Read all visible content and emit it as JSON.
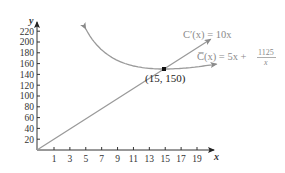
{
  "chart_data": {
    "type": "line",
    "title": "",
    "xlabel": "x",
    "ylabel": "y",
    "xlim": [
      0,
      20
    ],
    "ylim": [
      0,
      230
    ],
    "grid": false,
    "x_ticks": [
      1,
      3,
      5,
      7,
      9,
      11,
      13,
      15,
      17,
      19
    ],
    "y_ticks": [
      20,
      40,
      60,
      80,
      100,
      120,
      140,
      160,
      180,
      200,
      220
    ],
    "series": [
      {
        "name": "C'(x) = 10x",
        "label_main": "C′(x) = 10x",
        "formula": "10x",
        "x": [
          0,
          15,
          20.5
        ],
        "values": [
          0,
          150,
          205
        ],
        "color": "#9a9a9a"
      },
      {
        "name": "C̅(x) = 5x + 1125/x",
        "label_main": "C̅(x) = 5x + ",
        "label_num": "1125",
        "label_den": "x",
        "formula": "5x + 1125/x",
        "x": [
          6,
          7,
          8,
          9,
          10,
          11,
          12,
          13,
          14,
          15,
          16,
          17,
          18,
          19,
          20
        ],
        "values": [
          217.5,
          195.7,
          180.6,
          170,
          162.5,
          157.3,
          153.8,
          151.5,
          150.4,
          150,
          150.3,
          151.2,
          152.5,
          154.2,
          156.3
        ],
        "color": "#9a9a9a"
      }
    ],
    "annotations": [
      {
        "text": "(15, 150)",
        "x": 15,
        "y": 150,
        "marker": "square"
      }
    ],
    "legend": "inline labels at right"
  },
  "axes": {
    "x_name": "x",
    "y_name": "y"
  },
  "point_label": "(15, 150)",
  "colors": {
    "curve": "#9a9a9a",
    "axis": "#333333",
    "point": "#111111"
  }
}
